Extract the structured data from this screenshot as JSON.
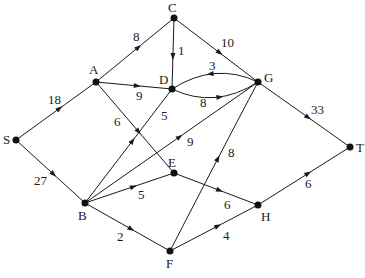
{
  "diagram": {
    "type": "directed-network-flow",
    "colors": {
      "stroke": "#1a1a1a",
      "node": "#111111",
      "background": "#ffffff"
    },
    "nodes": [
      {
        "id": "S",
        "label": "S",
        "x": 16,
        "y": 140,
        "lx": 3,
        "ly": 144
      },
      {
        "id": "A",
        "label": "A",
        "x": 96,
        "y": 82,
        "lx": 89,
        "ly": 74
      },
      {
        "id": "C",
        "label": "C",
        "x": 174,
        "y": 18,
        "lx": 168,
        "ly": 12
      },
      {
        "id": "D",
        "label": "D",
        "x": 172,
        "y": 89,
        "lx": 159,
        "ly": 84
      },
      {
        "id": "G",
        "label": "G",
        "x": 258,
        "y": 82,
        "lx": 264,
        "ly": 82
      },
      {
        "id": "T",
        "label": "T",
        "x": 350,
        "y": 147,
        "lx": 356,
        "ly": 152
      },
      {
        "id": "B",
        "label": "B",
        "x": 85,
        "y": 203,
        "lx": 78,
        "ly": 220
      },
      {
        "id": "E",
        "label": "E",
        "x": 174,
        "y": 173,
        "lx": 168,
        "ly": 167
      },
      {
        "id": "H",
        "label": "H",
        "x": 258,
        "y": 205,
        "lx": 261,
        "ly": 221
      },
      {
        "id": "F",
        "label": "F",
        "x": 170,
        "y": 251,
        "lx": 166,
        "ly": 268
      }
    ],
    "edges": [
      {
        "from": "S",
        "to": "A",
        "capacity": "18",
        "lx": 48,
        "ly": 104
      },
      {
        "from": "S",
        "to": "B",
        "capacity": "27",
        "lx": 34,
        "ly": 185
      },
      {
        "from": "A",
        "to": "C",
        "capacity": "8",
        "lx": 133,
        "ly": 41
      },
      {
        "from": "A",
        "to": "D",
        "capacity": "9",
        "lx": 136,
        "ly": 100
      },
      {
        "from": "A",
        "to": "E",
        "capacity": "6",
        "lx": 114,
        "ly": 126
      },
      {
        "from": "C",
        "to": "D",
        "capacity": "1",
        "lx": 178,
        "ly": 55
      },
      {
        "from": "C",
        "to": "G",
        "capacity": "10",
        "lx": 221,
        "ly": 47
      },
      {
        "from": "D",
        "to": "G",
        "capacity": "8",
        "lx": 200,
        "ly": 107,
        "curve": "lower"
      },
      {
        "from": "G",
        "to": "D",
        "capacity": "3",
        "lx": 209,
        "ly": 70,
        "curve": "upper"
      },
      {
        "from": "G",
        "to": "T",
        "capacity": "33",
        "lx": 311,
        "ly": 114
      },
      {
        "from": "B",
        "to": "D",
        "capacity": "5",
        "lx": 161,
        "ly": 120
      },
      {
        "from": "B",
        "to": "G",
        "capacity": "9",
        "lx": 187,
        "ly": 146
      },
      {
        "from": "B",
        "to": "E",
        "capacity": "5",
        "lx": 138,
        "ly": 199
      },
      {
        "from": "B",
        "to": "F",
        "capacity": "2",
        "lx": 117,
        "ly": 241
      },
      {
        "from": "E",
        "to": "H",
        "capacity": "6",
        "lx": 224,
        "ly": 209
      },
      {
        "from": "F",
        "to": "G",
        "capacity": "8",
        "lx": 228,
        "ly": 157,
        "curve": "bend"
      },
      {
        "from": "F",
        "to": "H",
        "capacity": "4",
        "lx": 223,
        "ly": 240
      },
      {
        "from": "H",
        "to": "T",
        "capacity": "6",
        "lx": 305,
        "ly": 188
      }
    ]
  }
}
